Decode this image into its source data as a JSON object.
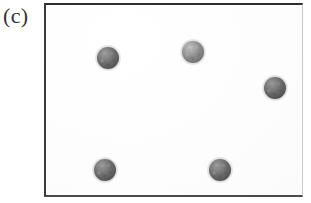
{
  "figure": {
    "panel_label": "(c)",
    "background_color": "#ffffff",
    "frame": {
      "border_color": "#2e2e2e",
      "fill_color": "#fefefe",
      "x": 44,
      "y": 3,
      "width": 259,
      "height": 194
    },
    "object_count": 5,
    "objects": [
      {
        "id": "sphere-top-left",
        "label": "sphere 1",
        "cx": 108,
        "cy": 58,
        "r": 11,
        "base_color": "#6e6e6e",
        "highlight_color": "#a0a0a0",
        "shadow_color": "#4a4a4a",
        "tone": "dark"
      },
      {
        "id": "sphere-top-center",
        "label": "sphere 2",
        "cx": 193,
        "cy": 52,
        "r": 11,
        "base_color": "#8e8e8e",
        "highlight_color": "#c2c2c2",
        "shadow_color": "#6a6a6a",
        "tone": "light"
      },
      {
        "id": "sphere-right",
        "label": "sphere 3",
        "cx": 275,
        "cy": 88,
        "r": 11,
        "base_color": "#6b6b6b",
        "highlight_color": "#9b9b9b",
        "shadow_color": "#474747",
        "tone": "dark"
      },
      {
        "id": "sphere-bottom-left",
        "label": "sphere 4",
        "cx": 105,
        "cy": 170,
        "r": 11,
        "base_color": "#6c6c6c",
        "highlight_color": "#9d9d9d",
        "shadow_color": "#484848",
        "tone": "dark"
      },
      {
        "id": "sphere-bottom-center",
        "label": "sphere 5",
        "cx": 220,
        "cy": 170,
        "r": 11,
        "base_color": "#6d6d6d",
        "highlight_color": "#9e9e9e",
        "shadow_color": "#494949",
        "tone": "dark"
      }
    ]
  }
}
